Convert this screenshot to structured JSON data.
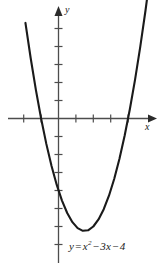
{
  "figure": {
    "background_color": "#ffffff",
    "curve_color": "#1a1a1a",
    "axis_color": "#4d4d4d",
    "width": 161,
    "height": 276
  },
  "labels": {
    "y_axis": "y",
    "x_axis": "x",
    "equation_y": "y",
    "equation_equals": "=",
    "equation_x": "x",
    "equation_exponent": "2",
    "equation_minus_1": "−",
    "equation_term_3x": "3x",
    "equation_minus_2": "−",
    "equation_constant": "4",
    "equation_full": "y = x² − 3x − 4"
  },
  "chart_data": {
    "type": "line",
    "function": "y = x^2 - 3x - 4",
    "xlabel": "x",
    "ylabel": "y",
    "grid": false,
    "legend": "none",
    "xlim": [
      -2.9,
      5.4
    ],
    "ylim": [
      -7.6,
      6.1
    ],
    "x_tick_interval": 1,
    "y_tick_interval": 1,
    "tick_labels_shown": false,
    "roots": [
      -1,
      4
    ],
    "vertex": [
      1.5,
      -6.25
    ],
    "y_intercept": -4,
    "x": [
      -1.9,
      -1.6,
      -1.3,
      -1.0,
      -0.7,
      -0.4,
      -0.1,
      0.2,
      0.5,
      0.8,
      1.1,
      1.4,
      1.7,
      2.0,
      2.3,
      2.6,
      2.9,
      3.2,
      3.5,
      3.8,
      4.1,
      4.4,
      4.7,
      5.0,
      5.3
    ],
    "y": [
      5.31,
      3.36,
      1.59,
      0.0,
      -1.41,
      -2.64,
      -3.69,
      -4.56,
      -5.25,
      -5.76,
      -6.09,
      -6.24,
      -6.21,
      -6.0,
      -5.61,
      -5.04,
      -4.29,
      -3.36,
      -2.25,
      -0.96,
      0.51,
      2.16,
      3.99,
      6.0,
      8.19
    ],
    "annotations": [
      {
        "text": "y = x² − 3x − 4",
        "position": "below-vertex"
      }
    ]
  },
  "icons": {
    "y_axis_arrow": "arrow-up-icon",
    "x_axis_arrow": "arrow-right-icon"
  }
}
